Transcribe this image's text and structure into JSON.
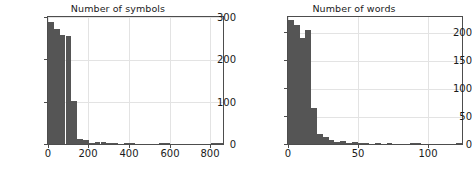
{
  "figure": {
    "background": "#ffffff",
    "bar_color": "#555555",
    "grid_color": "#e3e3e3",
    "axis_color": "#4d4d4d",
    "text_color": "#1a1a1a"
  },
  "panels": [
    {
      "id": "symbols",
      "title": "Number of symbols",
      "ytick_labels": [
        "300",
        "200",
        "100",
        "0"
      ],
      "xtick_labels": [
        "0",
        "200",
        "400",
        "600",
        "800"
      ]
    },
    {
      "id": "words",
      "title": "Number of words",
      "ytick_labels": [
        "200",
        "150",
        "100",
        "50",
        "0"
      ],
      "xtick_labels": [
        "0",
        "50",
        "100"
      ]
    }
  ],
  "chart_data": [
    {
      "type": "bar",
      "id": "symbols",
      "title": "Number of symbols",
      "xlabel": "",
      "ylabel": "",
      "xlim": [
        0,
        870
      ],
      "ylim": [
        0,
        300
      ],
      "xticks": [
        0,
        200,
        400,
        600,
        800
      ],
      "yticks": [
        0,
        100,
        200,
        300
      ],
      "grid": true,
      "legend": false,
      "bin_width": 29,
      "bin_edges": [
        0,
        29,
        58,
        87,
        116,
        145,
        174,
        203,
        232,
        261,
        290,
        319,
        348,
        377,
        406,
        435,
        464,
        493,
        522,
        551,
        580,
        609,
        638,
        667,
        696,
        725,
        754,
        783,
        812,
        841,
        870
      ],
      "values": [
        288,
        272,
        258,
        255,
        102,
        11,
        9,
        3,
        5,
        4,
        1,
        1,
        0,
        2,
        1,
        0,
        0,
        0,
        0,
        2,
        1,
        0,
        0,
        0,
        0,
        0,
        0,
        0,
        1,
        1
      ]
    },
    {
      "type": "bar",
      "id": "words",
      "title": "Number of words",
      "xlabel": "",
      "ylabel": "",
      "xlim": [
        0,
        125
      ],
      "ylim": [
        0,
        230
      ],
      "xticks": [
        0,
        50,
        100
      ],
      "yticks": [
        0,
        50,
        100,
        150,
        200
      ],
      "grid": true,
      "legend": false,
      "bin_width": 4.17,
      "bin_edges": [
        0,
        4.17,
        8.33,
        12.5,
        16.67,
        20.83,
        25,
        29.17,
        33.33,
        37.5,
        41.67,
        45.83,
        50,
        54.17,
        58.33,
        62.5,
        66.67,
        70.83,
        75,
        79.17,
        83.33,
        87.5,
        91.67,
        95.83,
        100,
        104.17,
        108.33,
        112.5,
        116.67,
        120.83,
        125
      ],
      "values": [
        224,
        215,
        192,
        206,
        66,
        18,
        12,
        7,
        4,
        5,
        2,
        3,
        1,
        1,
        0,
        1,
        0,
        1,
        0,
        0,
        0,
        1,
        1,
        0,
        0,
        0,
        0,
        0,
        0,
        1
      ]
    }
  ]
}
